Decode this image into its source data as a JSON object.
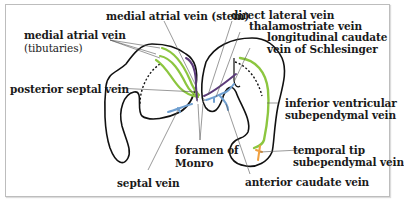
{
  "diagram": {
    "labels": {
      "medial_atrial_stem": "medial atrial vein (stem)",
      "medial_atrial_tributaries_1": "medial atrial vein",
      "medial_atrial_tributaries_2": "(tibutaries)",
      "posterior_septal": "posterior septal vein",
      "septal": "septal vein",
      "foramen_1": "foramen of",
      "foramen_2": "Monro",
      "direct_lateral": "direct lateral vein",
      "thalamostriate": "thalamostriate vein",
      "longitudinal_caudate_1": "longitudinal caudate",
      "longitudinal_caudate_2": "vein of Schlesinger",
      "inferior_ventricular_1": "inferior ventricular",
      "inferior_ventricular_2": "subependymal vein",
      "temporal_tip_1": "temporal tip",
      "temporal_tip_2": "subependymal vein",
      "anterior_caudate": "anterior caudate vein"
    },
    "colors": {
      "outline": "#111111",
      "green_vein": "#8cc63f",
      "purple_vein": "#5b3a7a",
      "blue_vein": "#6f9fd0",
      "orange_vein": "#f0a040",
      "leader_line": "#555555"
    }
  }
}
